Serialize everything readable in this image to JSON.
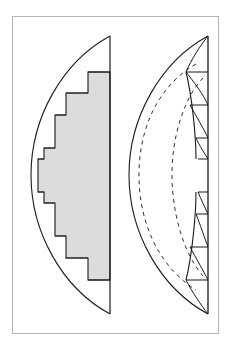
{
  "figure": {
    "caption": "",
    "canvas": {
      "width": 237,
      "height": 352,
      "background": "#ffffff"
    },
    "frame": {
      "name": "plate-border",
      "x": 12,
      "y": 16,
      "width": 207,
      "height": 318,
      "stroke": "#b4b4b4",
      "stroke_width": 1,
      "fill": "#ffffff"
    },
    "style": {
      "ink": "#1a1a1a",
      "shade_fill": "#dcdcdc",
      "shade_stroke": "#1a1a1a",
      "solid_stroke_width": 1.1,
      "thin_stroke_width": 0.9,
      "dash_pattern": "4,4",
      "dash_stroke_width": 0.9
    },
    "panels": [
      {
        "name": "left-panel",
        "label": "",
        "chord_x": 110,
        "top_y": 36,
        "bottom_y": 314,
        "arc_apex_x": 31,
        "arc_mid_y": 175,
        "shaded_polygon_points": "110,72 110,280 88,280 88,258 66,258 66,236 55,236 55,203 44,203 44,192 38,192 38,159 44,159 44,148 55,148 55,115 66,115 66,93 88,93 88,72",
        "step_rungs": [
          "38,192 44,192",
          "44,203 55,203",
          "55,236 66,236",
          "66,258 88,258",
          "38,159 44,159",
          "44,148 55,148",
          "55,115 66,115",
          "66,93 88,93"
        ]
      },
      {
        "name": "right-panel",
        "label": "",
        "chord_x": 208,
        "top_y": 36,
        "bottom_y": 314,
        "arc_apex_x": 129,
        "arc_mid_y": 175,
        "dashed_arcs": [
          {
            "name": "outer-dashed-arc",
            "apex_x": 139,
            "top_y": 64,
            "bottom_y": 290
          },
          {
            "name": "inner-dashed-arc",
            "apex_x": 172,
            "top_y": 78,
            "bottom_y": 276
          }
        ],
        "wedge_chords": [
          "186,72 208,72",
          "190,105 208,105",
          "196,138 208,138",
          "198,159 208,159",
          "198,192 208,192",
          "196,214 208,214",
          "190,247 208,247",
          "186,280 208,280"
        ],
        "wedge_rays": [
          "208,36 186,72",
          "186,72 208,105",
          "190,105 208,138",
          "196,138 208,159",
          "198,192 208,214",
          "196,214 208,247",
          "190,247 208,280",
          "186,280 208,314"
        ]
      }
    ]
  }
}
